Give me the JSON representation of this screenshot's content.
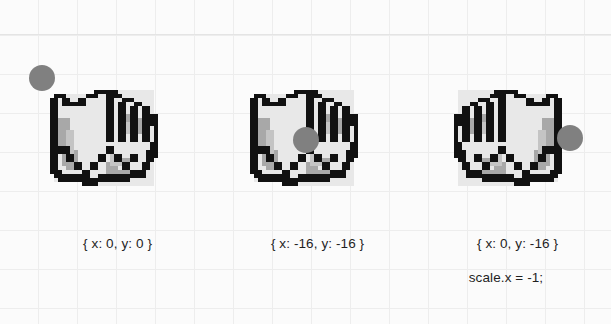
{
  "canvas": {
    "background_color": "#fbfbfb",
    "grid_color": "#ededed",
    "grid_size_px": 39,
    "width": 611,
    "height": 324
  },
  "palette": {
    "dot_color": "#808080",
    "sprite_outline": "#111111",
    "sprite_fill": "#e8e8e8",
    "sprite_shadow": "#9a9a9a",
    "text_color": "#1f1f1f"
  },
  "panels": [
    {
      "id": "panel-origin-top-left",
      "caption_line1": "{ x: 0, y: 0 }",
      "caption_line2": "",
      "anchor": {
        "x": 0,
        "y": 0
      },
      "mirrored": false,
      "dot": {
        "left_px": -13,
        "top_px": -13
      }
    },
    {
      "id": "panel-origin-center",
      "caption_line1": "{ x: -16, y: -16 }",
      "caption_line2": "",
      "anchor": {
        "x": -16,
        "y": -16
      },
      "mirrored": false,
      "dot": {
        "left_px": 51,
        "top_px": 49
      }
    },
    {
      "id": "panel-origin-mirrored",
      "caption_line1": "{ x: 0, y: -16 }",
      "caption_line2": "scale.x = -1;",
      "anchor": {
        "x": 0,
        "y": -16
      },
      "mirrored": true,
      "dot": {
        "left_px": 115,
        "top_px": 47
      }
    }
  ]
}
